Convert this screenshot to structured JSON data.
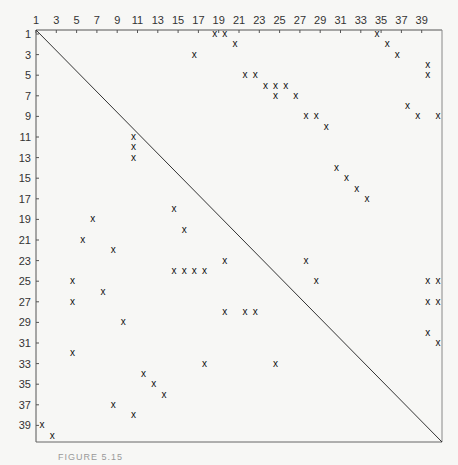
{
  "chart_data": {
    "type": "scatter",
    "title": "",
    "subtitle": "Sparse matrix structure (40×40) with diagonal",
    "xlabel": "",
    "ylabel": "",
    "xlim": [
      1,
      40
    ],
    "ylim": [
      1,
      40
    ],
    "x_axis_position": "top",
    "y_axis_inverted": true,
    "grid": false,
    "marker": "x",
    "x_tick_labels": [
      "1",
      "3",
      "5",
      "7",
      "9",
      "11",
      "13",
      "15",
      "17",
      "19",
      "21",
      "23",
      "25",
      "27",
      "29",
      "31",
      "33",
      "35",
      "37",
      "39"
    ],
    "y_tick_labels": [
      "1",
      "3",
      "5",
      "7",
      "9",
      "11",
      "13",
      "15",
      "17",
      "19",
      "21",
      "23",
      "25",
      "27",
      "29",
      "31",
      "33",
      "35",
      "37",
      "39"
    ],
    "diagonal_line": {
      "from": [
        1,
        1
      ],
      "to": [
        40,
        40
      ]
    },
    "points": [
      {
        "col": 18,
        "row": 1
      },
      {
        "col": 19,
        "row": 1
      },
      {
        "col": 34,
        "row": 1
      },
      {
        "col": 20,
        "row": 2
      },
      {
        "col": 35,
        "row": 2
      },
      {
        "col": 16,
        "row": 3
      },
      {
        "col": 36,
        "row": 3
      },
      {
        "col": 39,
        "row": 4
      },
      {
        "col": 39,
        "row": 5
      },
      {
        "col": 21,
        "row": 5
      },
      {
        "col": 22,
        "row": 5
      },
      {
        "col": 23,
        "row": 6
      },
      {
        "col": 24,
        "row": 6
      },
      {
        "col": 25,
        "row": 6
      },
      {
        "col": 24,
        "row": 7
      },
      {
        "col": 26,
        "row": 7
      },
      {
        "col": 37,
        "row": 8
      },
      {
        "col": 27,
        "row": 9
      },
      {
        "col": 28,
        "row": 9
      },
      {
        "col": 38,
        "row": 9
      },
      {
        "col": 40,
        "row": 9
      },
      {
        "col": 29,
        "row": 10
      },
      {
        "col": 10,
        "row": 11
      },
      {
        "col": 10,
        "row": 12
      },
      {
        "col": 10,
        "row": 13
      },
      {
        "col": 30,
        "row": 14
      },
      {
        "col": 31,
        "row": 15
      },
      {
        "col": 32,
        "row": 16
      },
      {
        "col": 33,
        "row": 17
      },
      {
        "col": 14,
        "row": 18
      },
      {
        "col": 6,
        "row": 19
      },
      {
        "col": 15,
        "row": 20
      },
      {
        "col": 5,
        "row": 21
      },
      {
        "col": 8,
        "row": 22
      },
      {
        "col": 19,
        "row": 23
      },
      {
        "col": 27,
        "row": 23
      },
      {
        "col": 14,
        "row": 24
      },
      {
        "col": 15,
        "row": 24
      },
      {
        "col": 16,
        "row": 24
      },
      {
        "col": 17,
        "row": 24
      },
      {
        "col": 4,
        "row": 25
      },
      {
        "col": 28,
        "row": 25
      },
      {
        "col": 39,
        "row": 25
      },
      {
        "col": 40,
        "row": 25
      },
      {
        "col": 7,
        "row": 26
      },
      {
        "col": 4,
        "row": 27
      },
      {
        "col": 39,
        "row": 27
      },
      {
        "col": 40,
        "row": 27
      },
      {
        "col": 19,
        "row": 28
      },
      {
        "col": 21,
        "row": 28
      },
      {
        "col": 22,
        "row": 28
      },
      {
        "col": 9,
        "row": 29
      },
      {
        "col": 39,
        "row": 30
      },
      {
        "col": 40,
        "row": 31
      },
      {
        "col": 4,
        "row": 32
      },
      {
        "col": 17,
        "row": 33
      },
      {
        "col": 24,
        "row": 33
      },
      {
        "col": 11,
        "row": 34
      },
      {
        "col": 12,
        "row": 35
      },
      {
        "col": 13,
        "row": 36
      },
      {
        "col": 8,
        "row": 37
      },
      {
        "col": 10,
        "row": 38
      },
      {
        "col": 1,
        "row": 39
      },
      {
        "col": 2,
        "row": 40
      }
    ]
  },
  "caption": "FIGURE 5.15"
}
